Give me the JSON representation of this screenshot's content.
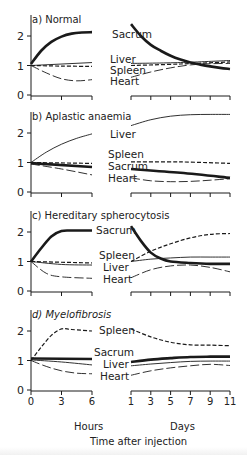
{
  "chart_data": {
    "type": "line",
    "xlabel": "Time after injection",
    "ylabel": "",
    "hours_axis": {
      "label": "Hours",
      "ticks": [
        0,
        3,
        6
      ],
      "range": [
        0,
        6
      ]
    },
    "days_axis": {
      "label": "Days",
      "ticks": [
        1,
        3,
        5,
        7,
        9,
        11
      ],
      "range": [
        1,
        11
      ]
    },
    "y_ticks": [
      0,
      1,
      2
    ],
    "ylim": [
      0,
      2.6
    ],
    "grid": false,
    "panels": [
      {
        "id": "a",
        "title": "a) Normal",
        "series": [
          {
            "name": "Sacrum",
            "style": "thick",
            "hours": [
              [
                0,
                1.05
              ],
              [
                1,
                1.5
              ],
              [
                2,
                1.8
              ],
              [
                3,
                1.98
              ],
              [
                4,
                2.08
              ],
              [
                5,
                2.12
              ],
              [
                6,
                2.13
              ]
            ],
            "days": [
              [
                1,
                2.4
              ],
              [
                2,
                2.0
              ],
              [
                3,
                1.7
              ],
              [
                4,
                1.5
              ],
              [
                5,
                1.33
              ],
              [
                6,
                1.2
              ],
              [
                7,
                1.1
              ],
              [
                8,
                1.03
              ],
              [
                9,
                0.97
              ],
              [
                10,
                0.92
              ],
              [
                11,
                0.88
              ]
            ]
          },
          {
            "name": "Liver",
            "style": "thin",
            "hours": [
              [
                0,
                1.0
              ],
              [
                6,
                1.1
              ]
            ],
            "days": [
              [
                1,
                1.07
              ],
              [
                6,
                1.1
              ],
              [
                11,
                1.17
              ]
            ]
          },
          {
            "name": "Spleen",
            "style": "dashed",
            "hours": [
              [
                0,
                1.0
              ],
              [
                3,
                0.98
              ],
              [
                6,
                0.97
              ]
            ],
            "days": [
              [
                1,
                1.0
              ],
              [
                6,
                1.05
              ],
              [
                11,
                1.12
              ]
            ]
          },
          {
            "name": "Heart",
            "style": "longdash",
            "hours": [
              [
                0,
                1.0
              ],
              [
                1.5,
                0.75
              ],
              [
                3,
                0.55
              ],
              [
                4.5,
                0.48
              ],
              [
                6,
                0.52
              ]
            ],
            "days": [
              [
                1,
                0.6
              ],
              [
                3,
                0.78
              ],
              [
                5,
                0.92
              ],
              [
                7,
                1.02
              ],
              [
                9,
                1.06
              ],
              [
                11,
                1.07
              ]
            ]
          }
        ],
        "labels": [
          {
            "text": "Sacrum",
            "x": 112,
            "y": 38
          },
          {
            "text": "Liver",
            "x": 110,
            "y": 63
          },
          {
            "text": "Spleen",
            "x": 110,
            "y": 74
          },
          {
            "text": "Heart",
            "x": 110,
            "y": 85
          }
        ],
        "y0": 95
      },
      {
        "id": "b",
        "title": "b) Aplastic anaemia",
        "series": [
          {
            "name": "Liver",
            "style": "thin",
            "hours": [
              [
                0,
                1.0
              ],
              [
                1.5,
                1.35
              ],
              [
                3,
                1.62
              ],
              [
                4.5,
                1.82
              ],
              [
                6,
                1.97
              ]
            ],
            "days": [
              [
                1,
                2.25
              ],
              [
                3,
                2.45
              ],
              [
                5,
                2.57
              ],
              [
                7,
                2.62
              ],
              [
                9,
                2.63
              ],
              [
                11,
                2.63
              ]
            ]
          },
          {
            "name": "Spleen",
            "style": "dashed",
            "hours": [
              [
                0,
                1.0
              ],
              [
                6,
                0.97
              ]
            ],
            "days": [
              [
                1,
                1.02
              ],
              [
                6,
                1.02
              ],
              [
                11,
                0.97
              ]
            ]
          },
          {
            "name": "Sacrum",
            "style": "thick",
            "hours": [
              [
                0,
                0.98
              ],
              [
                6,
                0.85
              ]
            ],
            "days": [
              [
                1,
                0.78
              ],
              [
                6,
                0.65
              ],
              [
                11,
                0.48
              ]
            ]
          },
          {
            "name": "Heart",
            "style": "longdash",
            "hours": [
              [
                0,
                0.95
              ],
              [
                3,
                0.78
              ],
              [
                6,
                0.58
              ]
            ],
            "days": [
              [
                1,
                0.48
              ],
              [
                3,
                0.38
              ],
              [
                5,
                0.35
              ],
              [
                7,
                0.36
              ],
              [
                9,
                0.4
              ],
              [
                11,
                0.45
              ]
            ]
          }
        ],
        "labels": [
          {
            "text": "Liver",
            "x": 110,
            "y": 138
          },
          {
            "text": "Spleen",
            "x": 108,
            "y": 158
          },
          {
            "text": "Sacrum",
            "x": 108,
            "y": 170
          },
          {
            "text": "Heart",
            "x": 108,
            "y": 182
          }
        ],
        "y0": 192
      },
      {
        "id": "c",
        "title": "c) Hereditary spherocytosis",
        "series": [
          {
            "name": "Sacrum",
            "style": "thick",
            "hours": [
              [
                0,
                1.0
              ],
              [
                1,
                1.45
              ],
              [
                2,
                1.85
              ],
              [
                3,
                2.03
              ],
              [
                4,
                2.05
              ],
              [
                6,
                2.05
              ]
            ],
            "days": [
              [
                1,
                2.2
              ],
              [
                2,
                1.7
              ],
              [
                3,
                1.3
              ],
              [
                4,
                1.1
              ],
              [
                5,
                1.0
              ],
              [
                7,
                0.95
              ],
              [
                9,
                0.92
              ],
              [
                11,
                0.92
              ]
            ]
          },
          {
            "name": "Spleen",
            "style": "dashed",
            "hours": [
              [
                0,
                1.0
              ],
              [
                6,
                0.95
              ]
            ],
            "days": [
              [
                1,
                1.0
              ],
              [
                3,
                1.35
              ],
              [
                5,
                1.6
              ],
              [
                7,
                1.8
              ],
              [
                9,
                1.92
              ],
              [
                11,
                1.95
              ]
            ]
          },
          {
            "name": "Liver",
            "style": "thin",
            "hours": [
              [
                0,
                1.0
              ],
              [
                3,
                0.9
              ],
              [
                6,
                0.88
              ]
            ],
            "days": [
              [
                1,
                1.0
              ],
              [
                3,
                1.08
              ],
              [
                5,
                1.12
              ],
              [
                7,
                1.15
              ],
              [
                9,
                1.15
              ],
              [
                11,
                1.15
              ]
            ]
          },
          {
            "name": "Heart",
            "style": "longdash",
            "hours": [
              [
                0,
                1.0
              ],
              [
                1.5,
                0.6
              ],
              [
                3,
                0.48
              ],
              [
                6,
                0.43
              ]
            ],
            "days": [
              [
                1,
                0.45
              ],
              [
                3,
                0.72
              ],
              [
                5,
                0.85
              ],
              [
                7,
                0.88
              ],
              [
                9,
                0.8
              ],
              [
                11,
                0.65
              ]
            ]
          }
        ],
        "labels": [
          {
            "text": "Sacrum",
            "x": 96,
            "y": 234
          },
          {
            "text": "Spleen",
            "x": 99,
            "y": 259
          },
          {
            "text": "Liver",
            "x": 103,
            "y": 271
          },
          {
            "text": "Heart",
            "x": 103,
            "y": 283
          }
        ],
        "y0": 291
      },
      {
        "id": "d",
        "title": "d) Myelofibrosis",
        "series": [
          {
            "name": "Spleen",
            "style": "dashed",
            "hours": [
              [
                0,
                1.0
              ],
              [
                1,
                1.45
              ],
              [
                2,
                1.85
              ],
              [
                3,
                2.07
              ],
              [
                4,
                2.05
              ],
              [
                6,
                2.0
              ]
            ],
            "days": [
              [
                1,
                2.07
              ],
              [
                3,
                1.8
              ],
              [
                5,
                1.62
              ],
              [
                7,
                1.53
              ],
              [
                9,
                1.52
              ],
              [
                11,
                1.5
              ]
            ]
          },
          {
            "name": "Sacrum",
            "style": "thick",
            "hours": [
              [
                0,
                1.07
              ],
              [
                6,
                1.05
              ]
            ],
            "days": [
              [
                1,
                0.95
              ],
              [
                3,
                1.03
              ],
              [
                5,
                1.08
              ],
              [
                7,
                1.12
              ],
              [
                9,
                1.13
              ],
              [
                11,
                1.13
              ]
            ]
          },
          {
            "name": "Liver",
            "style": "thin",
            "hours": [
              [
                0,
                1.02
              ],
              [
                3,
                0.95
              ],
              [
                6,
                0.85
              ]
            ],
            "days": [
              [
                1,
                0.82
              ],
              [
                3,
                0.88
              ],
              [
                5,
                0.93
              ],
              [
                7,
                0.97
              ],
              [
                9,
                0.98
              ],
              [
                11,
                0.98
              ]
            ]
          },
          {
            "name": "Heart",
            "style": "longdash",
            "hours": [
              [
                0,
                1.0
              ],
              [
                1.5,
                0.8
              ],
              [
                3,
                0.65
              ],
              [
                4.5,
                0.57
              ],
              [
                6,
                0.55
              ]
            ],
            "days": [
              [
                1,
                0.5
              ],
              [
                3,
                0.65
              ],
              [
                5,
                0.75
              ],
              [
                7,
                0.82
              ],
              [
                9,
                0.87
              ],
              [
                11,
                0.83
              ]
            ]
          }
        ],
        "labels": [
          {
            "text": "Spleen",
            "x": 99,
            "y": 334
          },
          {
            "text": "Sacrum",
            "x": 94,
            "y": 356
          },
          {
            "text": "Liver",
            "x": 103,
            "y": 368
          },
          {
            "text": "Heart",
            "x": 100,
            "y": 380
          }
        ],
        "y0": 390
      }
    ]
  },
  "figure": {
    "hours_label": "Hours",
    "days_label": "Days",
    "xaxis_title": "Time after injection",
    "colors": {
      "line": "#1a1a1a",
      "text": "#222222",
      "background": "#ffffff"
    }
  }
}
